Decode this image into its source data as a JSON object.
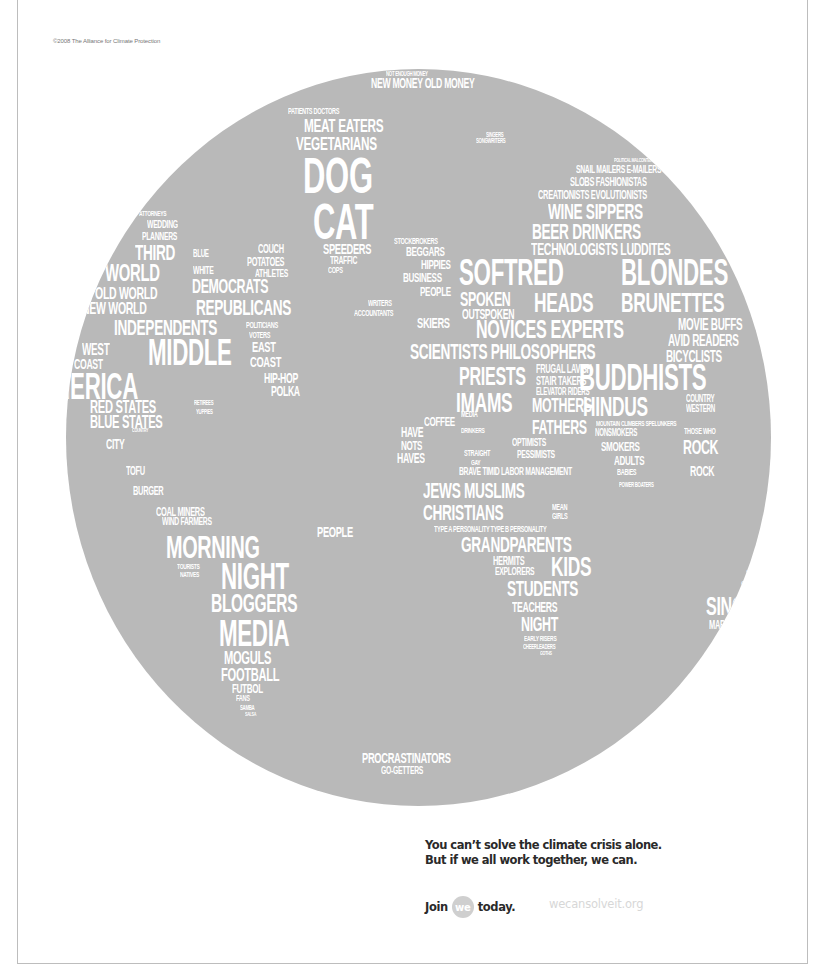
{
  "copyright": "©2008 The Alliance for Climate Protection",
  "globe": {
    "fill_color": "#b9b9b9",
    "text_color": "#ffffff",
    "words": [
      {
        "t": "NOT ENOUGH MONEY",
        "x": 320,
        "y": 1,
        "s": 7
      },
      {
        "t": "NEW MONEY OLD MONEY",
        "x": 305,
        "y": 7,
        "s": 14
      },
      {
        "t": "PATIENTS DOCTORS",
        "x": 222,
        "y": 38,
        "s": 9
      },
      {
        "t": "MEAT EATERS",
        "x": 238,
        "y": 47,
        "s": 19
      },
      {
        "t": "VEGETARIANS",
        "x": 230,
        "y": 65,
        "s": 19
      },
      {
        "t": "DOG",
        "x": 237,
        "y": 82,
        "s": 50
      },
      {
        "t": "CAT",
        "x": 247,
        "y": 128,
        "s": 50
      },
      {
        "t": "SPEEDERS",
        "x": 257,
        "y": 172,
        "s": 15
      },
      {
        "t": "TRAFFIC",
        "x": 264,
        "y": 186,
        "s": 11
      },
      {
        "t": "COPS",
        "x": 262,
        "y": 197,
        "s": 9
      },
      {
        "t": "SINGERS",
        "x": 420,
        "y": 62,
        "s": 7
      },
      {
        "t": "SONGWRITERS",
        "x": 410,
        "y": 68,
        "s": 7
      },
      {
        "t": "POLITICAL MALCONTENTS",
        "x": 548,
        "y": 88,
        "s": 6
      },
      {
        "t": "SNAIL MAILERS E-MAILERS",
        "x": 510,
        "y": 95,
        "s": 11
      },
      {
        "t": "SLOBS FASHIONISTAS",
        "x": 504,
        "y": 107,
        "s": 12
      },
      {
        "t": "CREATIONISTS EVOLUTIONISTS",
        "x": 472,
        "y": 120,
        "s": 12
      },
      {
        "t": "WINE SIPPERS",
        "x": 482,
        "y": 132,
        "s": 22
      },
      {
        "t": "BEER DRINKERS",
        "x": 466,
        "y": 152,
        "s": 22
      },
      {
        "t": "STOCKBROKERS",
        "x": 328,
        "y": 168,
        "s": 9
      },
      {
        "t": "BEGGARS",
        "x": 340,
        "y": 176,
        "s": 13
      },
      {
        "t": "TECHNOLOGISTS LUDDITES",
        "x": 465,
        "y": 172,
        "s": 17
      },
      {
        "t": "HIPPIES",
        "x": 355,
        "y": 189,
        "s": 13
      },
      {
        "t": "BUSINESS",
        "x": 337,
        "y": 202,
        "s": 13
      },
      {
        "t": "PEOPLE",
        "x": 354,
        "y": 216,
        "s": 13
      },
      {
        "t": "SOFTRED",
        "x": 393,
        "y": 186,
        "s": 36
      },
      {
        "t": "BLONDES",
        "x": 555,
        "y": 186,
        "s": 36
      },
      {
        "t": "SPOKEN",
        "x": 394,
        "y": 220,
        "s": 20
      },
      {
        "t": "HEADS",
        "x": 468,
        "y": 220,
        "s": 28
      },
      {
        "t": "BRUNETTES",
        "x": 555,
        "y": 220,
        "s": 28
      },
      {
        "t": "OUTSPOKEN",
        "x": 396,
        "y": 238,
        "s": 14
      },
      {
        "t": "WRITERS",
        "x": 302,
        "y": 230,
        "s": 9
      },
      {
        "t": "ACCOUNTANTS",
        "x": 288,
        "y": 240,
        "s": 9
      },
      {
        "t": "SKIERS",
        "x": 351,
        "y": 246,
        "s": 15
      },
      {
        "t": "NOVICES EXPERTS",
        "x": 410,
        "y": 247,
        "s": 26
      },
      {
        "t": "MOVIE BUFFS",
        "x": 612,
        "y": 248,
        "s": 16
      },
      {
        "t": "AVID READERS",
        "x": 602,
        "y": 264,
        "s": 16
      },
      {
        "t": "SCIENTISTS PHILOSOPHERS",
        "x": 344,
        "y": 272,
        "s": 22
      },
      {
        "t": "BICYCLISTS",
        "x": 600,
        "y": 280,
        "s": 16
      },
      {
        "t": "PRIESTS",
        "x": 393,
        "y": 294,
        "s": 26
      },
      {
        "t": "FRUGAL LAVISH",
        "x": 470,
        "y": 294,
        "s": 12
      },
      {
        "t": "STAIR TAKERS",
        "x": 470,
        "y": 306,
        "s": 12
      },
      {
        "t": "ELEVATOR RIDERS",
        "x": 470,
        "y": 318,
        "s": 10
      },
      {
        "t": "BUDDHISTS",
        "x": 513,
        "y": 291,
        "s": 36
      },
      {
        "t": "DRIVERS",
        "x": 700,
        "y": 285,
        "s": 13
      },
      {
        "t": "IMAMS",
        "x": 390,
        "y": 320,
        "s": 28
      },
      {
        "t": "MOTHERS",
        "x": 466,
        "y": 326,
        "s": 20
      },
      {
        "t": "HINDUS",
        "x": 517,
        "y": 324,
        "s": 28
      },
      {
        "t": "COUNTRY",
        "x": 620,
        "y": 325,
        "s": 10
      },
      {
        "t": "WESTERN",
        "x": 620,
        "y": 335,
        "s": 10
      },
      {
        "t": "MEDIA",
        "x": 395,
        "y": 341,
        "s": 9
      },
      {
        "t": "COFFEE",
        "x": 358,
        "y": 346,
        "s": 13
      },
      {
        "t": "FATHERS",
        "x": 466,
        "y": 348,
        "s": 20
      },
      {
        "t": "MOUNTAIN CLIMBERS SPELUNKERS",
        "x": 530,
        "y": 351,
        "s": 8
      },
      {
        "t": "NONSMOKERS",
        "x": 529,
        "y": 359,
        "s": 10
      },
      {
        "t": "THOSE WHO",
        "x": 618,
        "y": 358,
        "s": 9
      },
      {
        "t": "HAVE",
        "x": 335,
        "y": 356,
        "s": 14
      },
      {
        "t": "NOTS",
        "x": 335,
        "y": 370,
        "s": 13
      },
      {
        "t": "HAVES",
        "x": 331,
        "y": 382,
        "s": 14
      },
      {
        "t": "DRINKERS",
        "x": 395,
        "y": 358,
        "s": 8
      },
      {
        "t": "STRAIGHT",
        "x": 398,
        "y": 380,
        "s": 9
      },
      {
        "t": "GAY",
        "x": 405,
        "y": 390,
        "s": 8
      },
      {
        "t": "OPTIMISTS",
        "x": 446,
        "y": 368,
        "s": 11
      },
      {
        "t": "SMOKERS",
        "x": 535,
        "y": 371,
        "s": 13
      },
      {
        "t": "ROCK",
        "x": 617,
        "y": 368,
        "s": 20
      },
      {
        "t": "PESSIMISTS",
        "x": 451,
        "y": 380,
        "s": 11
      },
      {
        "t": "ADULTS",
        "x": 548,
        "y": 385,
        "s": 13
      },
      {
        "t": "ROCK",
        "x": 624,
        "y": 395,
        "s": 14
      },
      {
        "t": "BRAVE TIMID LABOR MANAGEMENT",
        "x": 393,
        "y": 397,
        "s": 11
      },
      {
        "t": "BABIES",
        "x": 551,
        "y": 399,
        "s": 9
      },
      {
        "t": "POWER BOATERS",
        "x": 553,
        "y": 412,
        "s": 7
      },
      {
        "t": "JEWS MUSLIMS",
        "x": 357,
        "y": 411,
        "s": 22
      },
      {
        "t": "CHRISTIANS",
        "x": 357,
        "y": 433,
        "s": 22
      },
      {
        "t": "MEAN",
        "x": 486,
        "y": 434,
        "s": 9
      },
      {
        "t": "GIRLS",
        "x": 486,
        "y": 443,
        "s": 9
      },
      {
        "t": "TYPE A PERSONALITY TYPE B PERSONALITY",
        "x": 368,
        "y": 456,
        "s": 9
      },
      {
        "t": "GRANDPARENTS",
        "x": 395,
        "y": 465,
        "s": 22
      },
      {
        "t": "HERMITS",
        "x": 427,
        "y": 486,
        "s": 12
      },
      {
        "t": "KIDS",
        "x": 485,
        "y": 484,
        "s": 28
      },
      {
        "t": "EXPLORERS",
        "x": 429,
        "y": 497,
        "s": 11
      },
      {
        "t": "STUDENTS",
        "x": 441,
        "y": 509,
        "s": 22
      },
      {
        "t": "TEACHERS",
        "x": 446,
        "y": 531,
        "s": 14
      },
      {
        "t": "NIGHT",
        "x": 455,
        "y": 545,
        "s": 20
      },
      {
        "t": "EARLY RISERS",
        "x": 458,
        "y": 566,
        "s": 8
      },
      {
        "t": "CHEERLEADERS",
        "x": 457,
        "y": 574,
        "s": 7
      },
      {
        "t": "GOTHS",
        "x": 474,
        "y": 581,
        "s": 6
      },
      {
        "t": "SOCIALISTS",
        "x": 680,
        "y": 500,
        "s": 9
      },
      {
        "t": "SOCIALITES",
        "x": 675,
        "y": 511,
        "s": 12
      },
      {
        "t": "SINGLE",
        "x": 640,
        "y": 524,
        "s": 26
      },
      {
        "t": "MARRIED",
        "x": 643,
        "y": 550,
        "s": 12
      },
      {
        "t": "THINKERS",
        "x": 654,
        "y": 563,
        "s": 8
      },
      {
        "t": "DOERS",
        "x": 649,
        "y": 571,
        "s": 11
      },
      {
        "t": "PROCRASTINATORS",
        "x": 296,
        "y": 681,
        "s": 15
      },
      {
        "t": "GO-GETTERS",
        "x": 315,
        "y": 696,
        "s": 11
      },
      {
        "t": "ATTORNEYS",
        "x": 73,
        "y": 141,
        "s": 8
      },
      {
        "t": "WEDDING",
        "x": 81,
        "y": 150,
        "s": 11
      },
      {
        "t": "PLANNERS",
        "x": 76,
        "y": 162,
        "s": 11
      },
      {
        "t": "THIRD",
        "x": 69,
        "y": 173,
        "s": 22
      },
      {
        "t": "BLUE",
        "x": 127,
        "y": 180,
        "s": 10
      },
      {
        "t": "COUCH",
        "x": 192,
        "y": 174,
        "s": 12
      },
      {
        "t": "POTATOES",
        "x": 181,
        "y": 187,
        "s": 12
      },
      {
        "t": "ATHLETES",
        "x": 189,
        "y": 199,
        "s": 11
      },
      {
        "t": "WORLD",
        "x": 39,
        "y": 192,
        "s": 24
      },
      {
        "t": "WHITE",
        "x": 127,
        "y": 196,
        "s": 11
      },
      {
        "t": "DEMOCRATS",
        "x": 126,
        "y": 207,
        "s": 20
      },
      {
        "t": "OLD WORLD",
        "x": 29,
        "y": 216,
        "s": 17
      },
      {
        "t": "NEW WORLD",
        "x": 16,
        "y": 231,
        "s": 17
      },
      {
        "t": "REPUBLICANS",
        "x": 130,
        "y": 228,
        "s": 22
      },
      {
        "t": "INDEPENDENTS",
        "x": 48,
        "y": 248,
        "s": 22
      },
      {
        "t": "POLITICIANS",
        "x": 180,
        "y": 252,
        "s": 9
      },
      {
        "t": "VOTERS",
        "x": 183,
        "y": 262,
        "s": 9
      },
      {
        "t": "WEST",
        "x": 16,
        "y": 273,
        "s": 16
      },
      {
        "t": "MIDDLE",
        "x": 82,
        "y": 266,
        "s": 36
      },
      {
        "t": "EAST",
        "x": 186,
        "y": 270,
        "s": 15
      },
      {
        "t": "COAST",
        "x": 8,
        "y": 288,
        "s": 14
      },
      {
        "t": "COAST",
        "x": 184,
        "y": 285,
        "s": 15
      },
      {
        "t": "AMERICA",
        "x": -30,
        "y": 300,
        "s": 36
      },
      {
        "t": "HIP-HOP",
        "x": 198,
        "y": 302,
        "s": 14
      },
      {
        "t": "POLKA",
        "x": 205,
        "y": 315,
        "s": 14
      },
      {
        "t": "RED STATES",
        "x": 24,
        "y": 329,
        "s": 18
      },
      {
        "t": "BLUE STATES",
        "x": 24,
        "y": 344,
        "s": 18
      },
      {
        "t": "RETIREES",
        "x": 128,
        "y": 330,
        "s": 7
      },
      {
        "t": "YUPPIES",
        "x": 130,
        "y": 339,
        "s": 7
      },
      {
        "t": "COUNTRY",
        "x": 66,
        "y": 358,
        "s": 6
      },
      {
        "t": "CITY",
        "x": 40,
        "y": 368,
        "s": 14
      },
      {
        "t": "TOFU",
        "x": 60,
        "y": 396,
        "s": 12
      },
      {
        "t": "BURGER",
        "x": 67,
        "y": 416,
        "s": 12
      },
      {
        "t": "COAL MINERS",
        "x": 90,
        "y": 437,
        "s": 12
      },
      {
        "t": "WIND FARMERS",
        "x": 96,
        "y": 447,
        "s": 11
      },
      {
        "t": "MORNING",
        "x": 100,
        "y": 462,
        "s": 32
      },
      {
        "t": "PEOPLE",
        "x": 251,
        "y": 455,
        "s": 15
      },
      {
        "t": "TOURISTS",
        "x": 111,
        "y": 494,
        "s": 8
      },
      {
        "t": "NATIVES",
        "x": 114,
        "y": 502,
        "s": 8
      },
      {
        "t": "NIGHT",
        "x": 155,
        "y": 490,
        "s": 36
      },
      {
        "t": "BLOGGERS",
        "x": 145,
        "y": 522,
        "s": 25
      },
      {
        "t": "MEDIA",
        "x": 153,
        "y": 547,
        "s": 36
      },
      {
        "t": "MOGULS",
        "x": 158,
        "y": 580,
        "s": 18
      },
      {
        "t": "FOOTBALL",
        "x": 155,
        "y": 597,
        "s": 18
      },
      {
        "t": "FUTBOL",
        "x": 166,
        "y": 613,
        "s": 13
      },
      {
        "t": "FANS",
        "x": 170,
        "y": 625,
        "s": 9
      },
      {
        "t": "SAMBA",
        "x": 174,
        "y": 635,
        "s": 7
      },
      {
        "t": "SALSA",
        "x": 179,
        "y": 642,
        "s": 6
      }
    ]
  },
  "tagline": {
    "line1": "You can’t solve the climate crisis alone.",
    "line2": "But if we all work together, we can."
  },
  "cta": {
    "join_label": "Join",
    "badge_label": "we",
    "today_label": "today.",
    "url": "wecansolveit.org"
  },
  "colors": {
    "globe": "#b9b9b9",
    "text_dark": "#2a2a2a",
    "url_light": "#d7d7d7",
    "badge": "#cfcfcf"
  }
}
